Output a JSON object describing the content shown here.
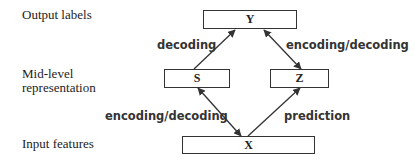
{
  "levels": {
    "output": "Output labels",
    "mid_line1": "Mid-level",
    "mid_line2": "representation",
    "input": "Input features"
  },
  "nodes": {
    "Y": "Y",
    "S": "S",
    "Z": "Z",
    "X": "X"
  },
  "edges": [
    {
      "from": "S",
      "to": "Y",
      "direction": "one-way",
      "label": "decoding"
    },
    {
      "from": "Y",
      "to": "Z",
      "direction": "bidirectional",
      "label": "encoding/decoding"
    },
    {
      "from": "S",
      "to": "X",
      "direction": "bidirectional",
      "label": "encoding/decoding"
    },
    {
      "from": "X",
      "to": "Z",
      "direction": "one-way",
      "label": "prediction"
    }
  ],
  "colors": {
    "stroke": "#333333",
    "text": "#222222",
    "background": "#ffffff"
  }
}
